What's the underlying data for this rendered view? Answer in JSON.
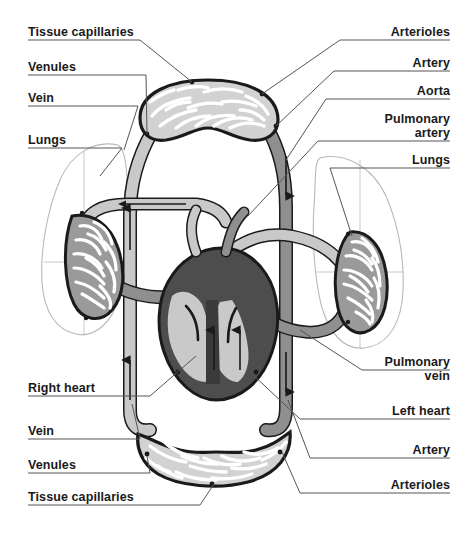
{
  "figure": {
    "background_color": "#ffffff"
  },
  "palette": {
    "outline": "#1a1a1a",
    "venous_light_gray": "#c9c9c9",
    "arterial_mid_gray": "#8f8f8f",
    "heart_dark_gray": "#4d4d4d",
    "heart_darkest": "#3a3a3a",
    "lung_silhouette_stroke": "#b5b5b5",
    "leader_line": "#555555",
    "label_text": "#1a1a1a",
    "capillary_fill_light": "#d2d2d2",
    "capillary_fill_mid": "#9a9a9a"
  },
  "labels": {
    "left": [
      {
        "id": "tissue-capillaries-top",
        "text": "Tissue capillaries",
        "x": 28,
        "y": 25
      },
      {
        "id": "venules-top",
        "text": "Venules",
        "x": 28,
        "y": 60
      },
      {
        "id": "vein-top",
        "text": "Vein",
        "x": 28,
        "y": 91
      },
      {
        "id": "lungs-left",
        "text": "Lungs",
        "x": 28,
        "y": 133
      },
      {
        "id": "right-heart",
        "text": "Right heart",
        "x": 28,
        "y": 381
      },
      {
        "id": "vein-bottom",
        "text": "Vein",
        "x": 28,
        "y": 424
      },
      {
        "id": "venules-bottom",
        "text": "Venules",
        "x": 28,
        "y": 458
      },
      {
        "id": "tissue-capillaries-bottom",
        "text": "Tissue capillaries",
        "x": 28,
        "y": 490
      }
    ],
    "right": [
      {
        "id": "arterioles-top",
        "text": "Arterioles",
        "x": 450,
        "y": 25
      },
      {
        "id": "artery-top",
        "text": "Artery",
        "x": 450,
        "y": 56
      },
      {
        "id": "aorta",
        "text": "Aorta",
        "x": 450,
        "y": 84
      },
      {
        "id": "pulmonary-artery",
        "text": "Pulmonary\nartery",
        "x": 450,
        "y": 112
      },
      {
        "id": "lungs-right",
        "text": "Lungs",
        "x": 450,
        "y": 153
      },
      {
        "id": "pulmonary-vein",
        "text": "Pulmonary\nvein",
        "x": 450,
        "y": 355
      },
      {
        "id": "left-heart",
        "text": "Left heart",
        "x": 450,
        "y": 404
      },
      {
        "id": "artery-bottom",
        "text": "Artery",
        "x": 450,
        "y": 443
      },
      {
        "id": "arterioles-bottom",
        "text": "Arterioles",
        "x": 450,
        "y": 478
      }
    ]
  },
  "anatomy": {
    "structures": [
      "top tissue capillary bed",
      "bottom tissue capillary bed",
      "left lung silhouette with pulmonary capillary bed",
      "right lung silhouette with pulmonary capillary bed",
      "four-chambered heart",
      "systemic vein (light gray) ascending on left",
      "systemic artery / aorta (mid gray) descending on right",
      "pulmonary artery and pulmonary vein"
    ],
    "flow_arrows": [
      "upward along left systemic veins",
      "downward along right systemic arteries",
      "leftward across upper transverse vessel",
      "upward inside heart chambers"
    ]
  }
}
